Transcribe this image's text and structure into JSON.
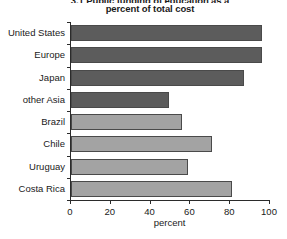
{
  "chart_data": {
    "type": "bar",
    "orientation": "horizontal",
    "title": "3.1 Public funding of education as a percent of total cost",
    "title_lines": [
      "3.1 Public funding of education as a",
      "percent of total cost"
    ],
    "categories": [
      "United States",
      "Europe",
      "Japan",
      "other Asia",
      "Brazil",
      "Chile",
      "Uruguay",
      "Costa Rica"
    ],
    "values": [
      96,
      96,
      87,
      49,
      56,
      71,
      59,
      81
    ],
    "bar_colors": [
      "#5c5c5c",
      "#5c5c5c",
      "#5c5c5c",
      "#5c5c5c",
      "#a3a3a3",
      "#a3a3a3",
      "#a3a3a3",
      "#a3a3a3"
    ],
    "xlabel": "percent",
    "ylabel": "",
    "xlim": [
      0,
      100
    ],
    "xticks": [
      0,
      20,
      40,
      60,
      80,
      100
    ],
    "xtick_labels": [
      "0",
      "20",
      "40",
      "60",
      "80",
      "100"
    ],
    "grid": false,
    "legend": null
  },
  "colors": {
    "axis": "#2b2b2b",
    "text": "#1a1a1a",
    "background": "#ffffff",
    "bar_dark": "#5c5c5c",
    "bar_light": "#a3a3a3",
    "bar_border": "#4a4a4a"
  }
}
